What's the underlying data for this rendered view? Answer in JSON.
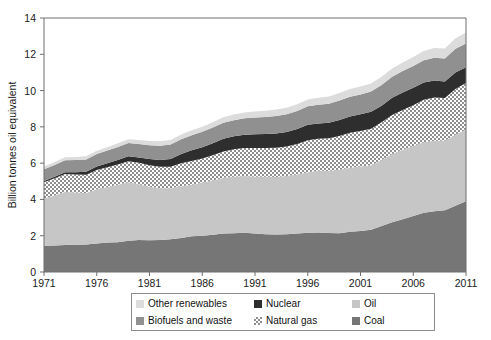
{
  "chart_data": {
    "type": "area",
    "stacked": true,
    "title": "",
    "xlabel": "",
    "ylabel": "Billion tonnes oil equivalent",
    "xlim": [
      1971,
      2011
    ],
    "ylim": [
      0,
      14
    ],
    "yticks": [
      0,
      2,
      4,
      6,
      8,
      10,
      12,
      14
    ],
    "xticks": [
      1971,
      1976,
      1981,
      1986,
      1991,
      1996,
      2001,
      2006,
      2011
    ],
    "grid": false,
    "legend_position": "bottom",
    "x": [
      1971,
      1972,
      1973,
      1974,
      1975,
      1976,
      1977,
      1978,
      1979,
      1980,
      1981,
      1982,
      1983,
      1984,
      1985,
      1986,
      1987,
      1988,
      1989,
      1990,
      1991,
      1992,
      1993,
      1994,
      1995,
      1996,
      1997,
      1998,
      1999,
      2000,
      2001,
      2002,
      2003,
      2004,
      2005,
      2006,
      2007,
      2008,
      2009,
      2010,
      2011
    ],
    "series": [
      {
        "name": "Coal",
        "fill": "#767676",
        "pattern": "solid",
        "values": [
          1.45,
          1.46,
          1.49,
          1.5,
          1.52,
          1.57,
          1.62,
          1.64,
          1.72,
          1.76,
          1.75,
          1.76,
          1.8,
          1.88,
          1.97,
          2.0,
          2.06,
          2.12,
          2.14,
          2.16,
          2.12,
          2.08,
          2.07,
          2.08,
          2.12,
          2.17,
          2.18,
          2.15,
          2.14,
          2.22,
          2.26,
          2.33,
          2.54,
          2.74,
          2.91,
          3.08,
          3.26,
          3.35,
          3.41,
          3.65,
          3.9
        ]
      },
      {
        "name": "Oil",
        "fill": "#c6c6c6",
        "pattern": "solid",
        "values": [
          2.6,
          2.76,
          2.93,
          2.88,
          2.83,
          2.99,
          3.07,
          3.17,
          3.22,
          3.08,
          2.95,
          2.86,
          2.81,
          2.85,
          2.84,
          2.93,
          2.99,
          3.07,
          3.11,
          3.13,
          3.13,
          3.17,
          3.16,
          3.21,
          3.26,
          3.33,
          3.41,
          3.42,
          3.5,
          3.53,
          3.55,
          3.56,
          3.64,
          3.77,
          3.83,
          3.86,
          3.89,
          3.88,
          3.83,
          3.92,
          3.95
        ]
      },
      {
        "name": "Natural gas",
        "fill": "#b4b4b4",
        "pattern": "checker",
        "values": [
          0.9,
          0.95,
          0.98,
          1.0,
          1.01,
          1.06,
          1.08,
          1.11,
          1.17,
          1.18,
          1.18,
          1.18,
          1.19,
          1.27,
          1.31,
          1.33,
          1.39,
          1.45,
          1.51,
          1.54,
          1.58,
          1.59,
          1.62,
          1.63,
          1.67,
          1.76,
          1.76,
          1.8,
          1.85,
          1.92,
          1.96,
          2.01,
          2.07,
          2.14,
          2.19,
          2.25,
          2.34,
          2.39,
          2.35,
          2.51,
          2.57
        ]
      },
      {
        "name": "Nuclear",
        "fill": "#2e2e2e",
        "pattern": "solid",
        "values": [
          0.07,
          0.08,
          0.1,
          0.12,
          0.16,
          0.19,
          0.22,
          0.25,
          0.27,
          0.29,
          0.35,
          0.38,
          0.43,
          0.51,
          0.59,
          0.62,
          0.66,
          0.71,
          0.72,
          0.73,
          0.76,
          0.77,
          0.79,
          0.8,
          0.83,
          0.85,
          0.84,
          0.86,
          0.89,
          0.9,
          0.92,
          0.93,
          0.92,
          0.95,
          0.96,
          0.96,
          0.95,
          0.94,
          0.91,
          0.92,
          0.86
        ]
      },
      {
        "name": "Biofuels and waste",
        "fill": "#909090",
        "pattern": "solid",
        "values": [
          0.64,
          0.65,
          0.66,
          0.67,
          0.68,
          0.69,
          0.7,
          0.72,
          0.73,
          0.75,
          0.76,
          0.78,
          0.8,
          0.81,
          0.83,
          0.85,
          0.86,
          0.88,
          0.89,
          0.91,
          0.92,
          0.94,
          0.96,
          0.98,
          1.0,
          1.02,
          1.03,
          1.05,
          1.07,
          1.09,
          1.1,
          1.12,
          1.14,
          1.16,
          1.19,
          1.21,
          1.23,
          1.25,
          1.27,
          1.3,
          1.32
        ]
      },
      {
        "name": "Other renewables",
        "fill": "#dcdcdc",
        "pattern": "solid",
        "values": [
          0.15,
          0.16,
          0.16,
          0.17,
          0.18,
          0.18,
          0.19,
          0.2,
          0.21,
          0.22,
          0.23,
          0.24,
          0.25,
          0.26,
          0.27,
          0.28,
          0.29,
          0.3,
          0.31,
          0.32,
          0.33,
          0.34,
          0.35,
          0.36,
          0.37,
          0.38,
          0.39,
          0.4,
          0.41,
          0.42,
          0.43,
          0.44,
          0.45,
          0.46,
          0.47,
          0.49,
          0.51,
          0.53,
          0.55,
          0.58,
          0.6
        ]
      }
    ]
  },
  "legend": {
    "entries": [
      {
        "label": "Other renewables",
        "color": "#dcdcdc",
        "pattern": "solid"
      },
      {
        "label": "Nuclear",
        "color": "#2e2e2e",
        "pattern": "solid"
      },
      {
        "label": "Oil",
        "color": "#c6c6c6",
        "pattern": "solid"
      },
      {
        "label": "Biofuels and waste",
        "color": "#909090",
        "pattern": "solid"
      },
      {
        "label": "Natural gas",
        "color": "#b4b4b4",
        "pattern": "checker"
      },
      {
        "label": "Coal",
        "color": "#767676",
        "pattern": "solid"
      }
    ]
  }
}
